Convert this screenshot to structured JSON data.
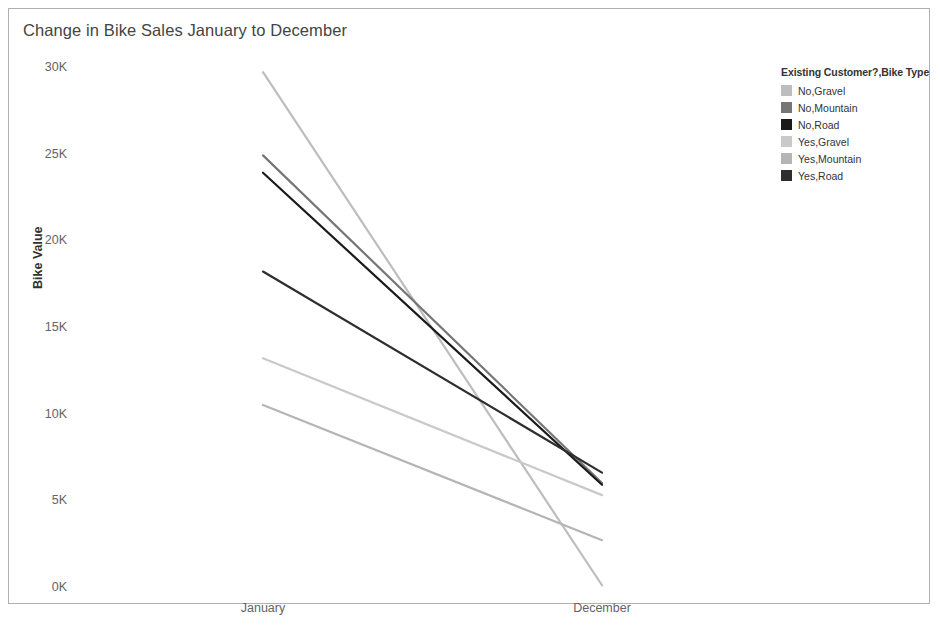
{
  "chart_data": {
    "type": "line",
    "title": "Change in Bike Sales January to December",
    "xlabel": "",
    "ylabel": "Bike Value",
    "categories": [
      "January",
      "December"
    ],
    "x_tick_labels": [
      "January",
      "December"
    ],
    "y_tick_labels": [
      "0K",
      "5K",
      "10K",
      "15K",
      "20K",
      "25K",
      "30K"
    ],
    "y_tick_values": [
      0,
      5000,
      10000,
      15000,
      20000,
      25000,
      30000
    ],
    "ylim": [
      0,
      30000
    ],
    "grid": false,
    "legend_position": "right",
    "legend_title": "Existing Customer?,Bike Type",
    "series": [
      {
        "name": "No,Gravel",
        "color": "#bdbdbd",
        "values": [
          29700,
          100
        ]
      },
      {
        "name": "No,Mountain",
        "color": "#767676",
        "values": [
          24900,
          6000
        ]
      },
      {
        "name": "No,Road",
        "color": "#1a1a1a",
        "values": [
          23900,
          5900
        ]
      },
      {
        "name": "Yes,Gravel",
        "color": "#c9c9c9",
        "values": [
          13200,
          5300
        ]
      },
      {
        "name": "Yes,Mountain",
        "color": "#b5b5b5",
        "values": [
          10500,
          2700
        ]
      },
      {
        "name": "Yes,Road",
        "color": "#2e2e2e",
        "values": [
          18200,
          6600
        ]
      }
    ]
  },
  "legend": {
    "title": "Existing Customer?,Bike Type",
    "items": [
      {
        "label": "No,Gravel",
        "color": "#bdbdbd"
      },
      {
        "label": "No,Mountain",
        "color": "#767676"
      },
      {
        "label": "No,Road",
        "color": "#1a1a1a"
      },
      {
        "label": "Yes,Gravel",
        "color": "#c9c9c9"
      },
      {
        "label": "Yes,Mountain",
        "color": "#b5b5b5"
      },
      {
        "label": "Yes,Road",
        "color": "#2e2e2e"
      }
    ]
  },
  "axes": {
    "y_title": "Bike Value"
  }
}
